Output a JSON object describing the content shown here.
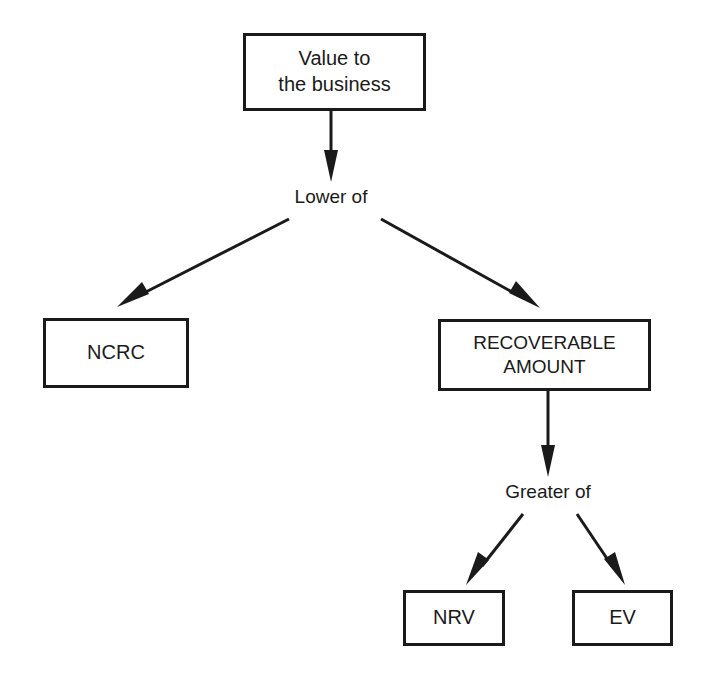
{
  "diagram": {
    "ink_color": "#1a1a1a",
    "background_color": "#ffffff",
    "nodes": [
      {
        "id": "value",
        "text": "Value to\nthe business",
        "shape": "rectangle"
      },
      {
        "id": "ncrc",
        "text": "NCRC",
        "shape": "rectangle"
      },
      {
        "id": "recoverable",
        "text": "RECOVERABLE\nAMOUNT",
        "shape": "rectangle"
      },
      {
        "id": "nrv",
        "text": "NRV",
        "shape": "rectangle"
      },
      {
        "id": "ev",
        "text": "EV",
        "shape": "rectangle"
      }
    ],
    "connector_labels": [
      {
        "id": "lower",
        "text": "Lower of"
      },
      {
        "id": "greater",
        "text": "Greater of"
      }
    ],
    "edges": [
      {
        "from": "value",
        "to": "lower",
        "style": "arrow-down"
      },
      {
        "from": "lower",
        "to": "ncrc",
        "style": "arrow-diagonal-left"
      },
      {
        "from": "lower",
        "to": "recoverable",
        "style": "arrow-diagonal-right"
      },
      {
        "from": "recoverable",
        "to": "greater",
        "style": "arrow-down"
      },
      {
        "from": "greater",
        "to": "nrv",
        "style": "arrow-diagonal-left"
      },
      {
        "from": "greater",
        "to": "ev",
        "style": "arrow-diagonal-right"
      }
    ]
  }
}
